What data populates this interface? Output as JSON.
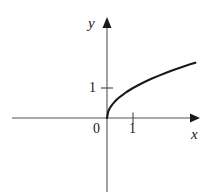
{
  "figure": {
    "background_color": "#ffffff",
    "line_color": "#1a1a1a",
    "axis_color": "#555555"
  },
  "labels": {
    "y_axis": "y",
    "x_axis": "x",
    "origin": "0",
    "x_tick_1": "1",
    "y_tick_1": "1"
  },
  "chart_data": {
    "type": "line",
    "title": "",
    "xlabel": "x",
    "ylabel": "y",
    "equation": "y = sqrt(x)",
    "grid": false,
    "legend": null,
    "xlim": [
      -3.6,
      4.2
    ],
    "ylim": [
      -2.5,
      3.3
    ],
    "xticks": [
      0,
      1
    ],
    "xtick_labels": [
      "0",
      "1"
    ],
    "yticks": [
      1
    ],
    "ytick_labels": [
      "1"
    ],
    "series": [
      {
        "name": "y = sqrt(x)",
        "x": [
          0,
          0.05,
          0.1,
          0.2,
          0.3,
          0.4,
          0.5,
          0.75,
          1,
          1.25,
          1.5,
          1.75,
          2,
          2.25,
          2.5,
          2.75,
          3,
          3.2,
          3.4
        ],
        "y": [
          0,
          0.224,
          0.316,
          0.447,
          0.548,
          0.632,
          0.707,
          0.866,
          1,
          1.118,
          1.225,
          1.323,
          1.414,
          1.5,
          1.581,
          1.658,
          1.732,
          1.789,
          1.844
        ]
      }
    ]
  }
}
